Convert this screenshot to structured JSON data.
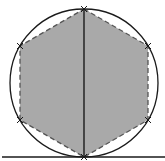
{
  "diagram": {
    "type": "geometric-construction",
    "colors": {
      "background": "#ffffff",
      "stroke": "#1a1a1a",
      "hexagon_fill": "#a9a9a9",
      "hexagon_edge": "#555555"
    },
    "circle": {
      "cx": 84,
      "cy": 83,
      "r": 74
    },
    "hexagon": {
      "vertices": [
        [
          84,
          9
        ],
        [
          148,
          46
        ],
        [
          148,
          120
        ],
        [
          84,
          157
        ],
        [
          20,
          120
        ],
        [
          20,
          46
        ]
      ],
      "edge_style": "dashed"
    },
    "diameter": {
      "x1": 84,
      "y1": 9,
      "x2": 84,
      "y2": 157
    },
    "baseline": {
      "x1": 2,
      "y1": 157,
      "x2": 165,
      "y2": 157
    },
    "vertex_marks": "x-ticks"
  }
}
